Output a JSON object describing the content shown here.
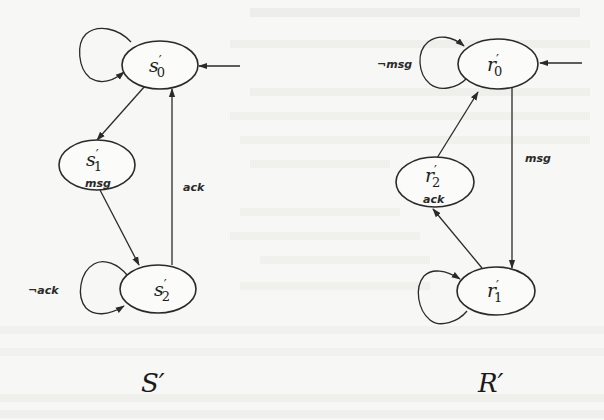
{
  "diagram": {
    "automata": [
      {
        "id": "S",
        "title": "S′",
        "states": [
          {
            "id": "s0",
            "name": "s",
            "prime": "′",
            "sub": "0",
            "initial": true,
            "output": ""
          },
          {
            "id": "s1",
            "name": "s",
            "prime": "′",
            "sub": "1",
            "initial": false,
            "output": "msg"
          },
          {
            "id": "s2",
            "name": "s",
            "prime": "′",
            "sub": "2",
            "initial": false,
            "output": ""
          }
        ],
        "transitions": [
          {
            "from": "s0",
            "to": "s0",
            "label": ""
          },
          {
            "from": "s0",
            "to": "s1",
            "label": ""
          },
          {
            "from": "s1",
            "to": "s2",
            "label": ""
          },
          {
            "from": "s2",
            "to": "s2",
            "label": "¬ack"
          },
          {
            "from": "s2",
            "to": "s0",
            "label": "ack"
          }
        ]
      },
      {
        "id": "R",
        "title": "R′",
        "states": [
          {
            "id": "r0",
            "name": "r",
            "prime": "′",
            "sub": "0",
            "initial": true,
            "output": ""
          },
          {
            "id": "r1",
            "name": "r",
            "prime": "′",
            "sub": "1",
            "initial": false,
            "output": ""
          },
          {
            "id": "r2",
            "name": "r",
            "prime": "′",
            "sub": "2",
            "initial": false,
            "output": "ack"
          }
        ],
        "transitions": [
          {
            "from": "r0",
            "to": "r0",
            "label": "¬msg"
          },
          {
            "from": "r0",
            "to": "r1",
            "label": "msg"
          },
          {
            "from": "r1",
            "to": "r1",
            "label": ""
          },
          {
            "from": "r1",
            "to": "r2",
            "label": ""
          },
          {
            "from": "r2",
            "to": "r0",
            "label": ""
          }
        ]
      }
    ]
  },
  "colors": {
    "background": "#f7f7f5",
    "ink": "#2a2a2a"
  }
}
